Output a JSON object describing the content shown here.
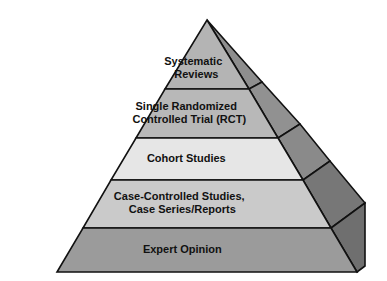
{
  "figure": {
    "name": "evidence-pyramid",
    "background_color": "#ffffff",
    "outline_color": "#111111",
    "text_color": "#111111"
  },
  "pyramid": {
    "orientation": "apex-top",
    "tier_count": 5,
    "tiers": [
      {
        "rank": 1,
        "position": "top",
        "lines": [
          "Systematic",
          "Reviews"
        ],
        "text": "Systematic Reviews",
        "face_color": "#b4b4b4",
        "side_color": "#8e8e8e"
      },
      {
        "rank": 2,
        "position": "second",
        "lines": [
          "Single Randomized",
          "Controlled Trial (RCT)"
        ],
        "text": "Single Randomized Controlled Trial (RCT)",
        "face_color": "#b8b8b8",
        "side_color": "#919191"
      },
      {
        "rank": 3,
        "position": "middle",
        "lines": [
          "Cohort Studies"
        ],
        "text": "Cohort Studies",
        "face_color": "#e6e6e6",
        "side_color": "#8a8a8a"
      },
      {
        "rank": 4,
        "position": "fourth",
        "lines": [
          "Case-Controlled Studies,",
          "Case Series/Reports"
        ],
        "text": "Case-Controlled Studies, Case Series/Reports",
        "face_color": "#cacaca",
        "side_color": "#777777"
      },
      {
        "rank": 5,
        "position": "bottom",
        "lines": [
          "Expert Opinion"
        ],
        "text": "Expert Opinion",
        "face_color": "#9b9b9b",
        "side_color": "#6f6f6f"
      }
    ]
  }
}
